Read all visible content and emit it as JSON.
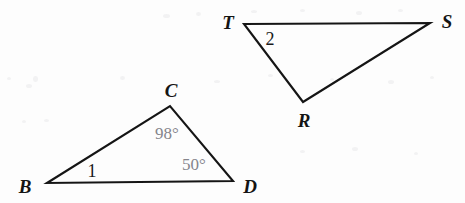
{
  "figure": {
    "background_color": "#fdfdfd",
    "stroke_color": "#151515",
    "label_color": "#141414",
    "measure_color": "#85858c",
    "width": 465,
    "height": 203
  },
  "triangles": [
    {
      "name": "triangle-bcd",
      "vertices": [
        {
          "label": "B",
          "x": 47,
          "y": 183,
          "label_x": 25,
          "label_y": 186
        },
        {
          "label": "C",
          "x": 170,
          "y": 106,
          "label_x": 171,
          "label_y": 90
        },
        {
          "label": "D",
          "x": 233,
          "y": 181,
          "label_x": 250,
          "label_y": 186
        }
      ],
      "path": "M 47 183 L 170 106 L 233 181 Z"
    },
    {
      "name": "triangle-tsr",
      "vertices": [
        {
          "label": "T",
          "x": 244,
          "y": 24,
          "label_x": 228,
          "label_y": 22
        },
        {
          "label": "S",
          "x": 430,
          "y": 23,
          "label_x": 447,
          "label_y": 21
        },
        {
          "label": "R",
          "x": 303,
          "y": 102,
          "label_x": 304,
          "label_y": 120
        }
      ],
      "path": "M 244 24 L 430 23 L 303 102 Z"
    }
  ],
  "angle_numbers": [
    {
      "name": "angle-1-at-b",
      "text": "1",
      "x": 92,
      "y": 171
    },
    {
      "name": "angle-2-at-t",
      "text": "2",
      "x": 270,
      "y": 39
    }
  ],
  "angle_measures": [
    {
      "name": "angle-measure-at-c",
      "text": "98°",
      "x": 167,
      "y": 133
    },
    {
      "name": "angle-measure-at-d",
      "text": "50°",
      "x": 194,
      "y": 164
    }
  ],
  "scan_specks": [
    {
      "x": 7,
      "y": 77,
      "w": 4,
      "h": 3
    },
    {
      "x": 26,
      "y": 84,
      "w": 6,
      "h": 4
    },
    {
      "x": 33,
      "y": 76,
      "w": 5,
      "h": 6
    },
    {
      "x": 22,
      "y": 120,
      "w": 4,
      "h": 3
    },
    {
      "x": 44,
      "y": 119,
      "w": 5,
      "h": 3
    },
    {
      "x": 163,
      "y": 14,
      "w": 7,
      "h": 4
    },
    {
      "x": 196,
      "y": 12,
      "w": 5,
      "h": 4
    },
    {
      "x": 251,
      "y": 10,
      "w": 6,
      "h": 3
    },
    {
      "x": 300,
      "y": 9,
      "w": 5,
      "h": 3
    },
    {
      "x": 356,
      "y": 11,
      "w": 6,
      "h": 4
    },
    {
      "x": 398,
      "y": 9,
      "w": 5,
      "h": 3
    },
    {
      "x": 120,
      "y": 76,
      "w": 5,
      "h": 4
    },
    {
      "x": 214,
      "y": 80,
      "w": 6,
      "h": 3
    },
    {
      "x": 268,
      "y": 74,
      "w": 5,
      "h": 3
    },
    {
      "x": 330,
      "y": 78,
      "w": 4,
      "h": 3
    },
    {
      "x": 388,
      "y": 80,
      "w": 6,
      "h": 4
    },
    {
      "x": 430,
      "y": 76,
      "w": 4,
      "h": 3
    },
    {
      "x": 300,
      "y": 150,
      "w": 5,
      "h": 3
    },
    {
      "x": 352,
      "y": 147,
      "w": 6,
      "h": 4
    },
    {
      "x": 414,
      "y": 152,
      "w": 4,
      "h": 3
    }
  ]
}
